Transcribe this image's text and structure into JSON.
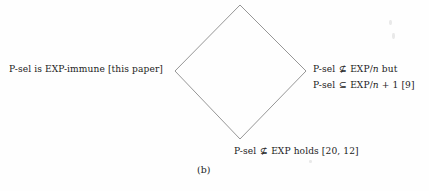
{
  "figure": {
    "caption": "(b)",
    "shape": "diamond",
    "line_color": "#8a8a8a",
    "background_color": "#fefefe",
    "text_color": "#1c1c1c",
    "vertices": {
      "top": [
        240,
        5
      ],
      "left": [
        175,
        71
      ],
      "right": [
        306,
        71
      ],
      "bottom": [
        240,
        139
      ]
    }
  },
  "labels": {
    "left": "P-sel is EXP-immune [this paper]",
    "right_line1": "P-sel ⊈ EXP/n but",
    "right_line2": "P-sel ⊆ EXP/n + 1 [9]",
    "bottom": "P-sel ⊈ EXP holds [20, 12]"
  },
  "label_parts": {
    "left": {
      "text": "P-sel is EXP-immune [this paper]"
    },
    "right_line1": {
      "prefix": "P-sel",
      "operator": "⊈",
      "base": "EXP/",
      "variable": "n",
      "suffix": "but"
    },
    "right_line2": {
      "prefix": "P-sel",
      "operator": "⊆",
      "base": "EXP/",
      "variable": "n",
      "suffix": "+ 1 [9]"
    },
    "bottom": {
      "prefix": "P-sel",
      "operator": "⊈",
      "suffix": "EXP holds [20, 12]"
    }
  }
}
